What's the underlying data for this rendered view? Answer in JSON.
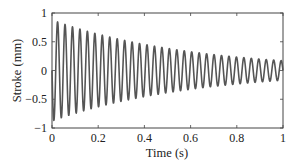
{
  "chart_data": {
    "type": "line",
    "title": "",
    "xlabel": "Time (s)",
    "ylabel": "Stroke (mm)",
    "xlim": [
      0,
      1
    ],
    "ylim": [
      -1,
      1
    ],
    "xticks": [
      0,
      0.2,
      0.4,
      0.6,
      0.8,
      1
    ],
    "xtick_labels": [
      "0",
      "0.2",
      "0.4",
      "0.6",
      "0.8",
      "1"
    ],
    "yticks": [
      -1,
      -0.5,
      0,
      0.5,
      1
    ],
    "ytick_labels": [
      "−1",
      "−0.5",
      "0",
      "0.5",
      "1"
    ],
    "grid": false,
    "legend": null,
    "series": [
      {
        "name": "Stroke",
        "color": "#555555",
        "model": "damped_sine",
        "description": "Damped sinusoidal oscillation starting at 0, first swinging negative",
        "frequency_hz": 31,
        "initial_amplitude": 0.88,
        "decay_rate_per_s": 1.65,
        "phase": "negative-sine",
        "envelope_samples": {
          "t": [
            0.0,
            0.2,
            0.4,
            0.6,
            0.8,
            1.0
          ],
          "amplitude": [
            0.88,
            0.63,
            0.45,
            0.33,
            0.23,
            0.17
          ]
        },
        "first_peak": {
          "t": 0.025,
          "y": 0.85
        },
        "first_trough": {
          "t": 0.008,
          "y": -0.88
        }
      }
    ]
  }
}
